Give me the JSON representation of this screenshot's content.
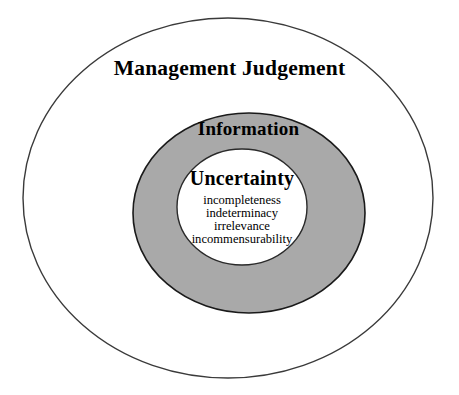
{
  "diagram": {
    "type": "nested-ellipse-venn",
    "title_outer": "Management Judgement",
    "title_middle": "Information",
    "title_inner": "Uncertainty",
    "layers": [
      {
        "name": "management-judgement",
        "label": "Management Judgement",
        "fill": "#ffffff",
        "stroke": "#3a3a3a"
      },
      {
        "name": "information",
        "label": "Information",
        "fill": "#a9a9a9",
        "stroke": "#1a1a1a"
      },
      {
        "name": "uncertainty",
        "label": "Uncertainty",
        "fill": "#ffffff",
        "stroke": "#2a2a2a"
      }
    ],
    "uncertainty_aspects": [
      "incompleteness",
      "indeterminacy",
      "irrelevance",
      "incommensurability"
    ],
    "colors": {
      "background": "#ffffff",
      "gray_fill": "#a9a9a9",
      "outline": "#3a3a3a",
      "text": "#000000"
    },
    "geometry": {
      "outer_ellipse": {
        "cx": 228,
        "cy": 198,
        "rx": 205,
        "ry": 180
      },
      "middle_ellipse": {
        "cx": 249,
        "cy": 213,
        "rx": 116,
        "ry": 100
      },
      "inner_ellipse": {
        "cx": 242,
        "cy": 207,
        "rx": 65,
        "ry": 58
      }
    }
  }
}
